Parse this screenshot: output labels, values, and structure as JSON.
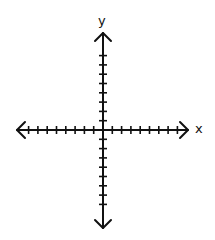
{
  "diagram": {
    "type": "coordinate-plane",
    "style": "hand-drawn",
    "x_axis": {
      "label": "x",
      "ticks_negative": 8,
      "ticks_positive": 8,
      "arrows": "both"
    },
    "y_axis": {
      "label": "y",
      "ticks_negative": 8,
      "ticks_positive": 8,
      "arrows": "both"
    },
    "colors": {
      "stroke": "#111111",
      "background": "#ffffff"
    }
  }
}
